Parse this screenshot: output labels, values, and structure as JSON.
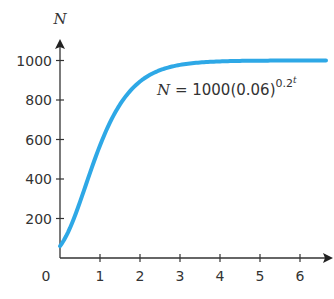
{
  "chart_data": {
    "type": "line",
    "title": "",
    "xlabel": "t",
    "ylabel": "N",
    "xlim": [
      0,
      6.5
    ],
    "ylim": [
      0,
      1100
    ],
    "x_ticks": [
      1,
      2,
      3,
      4,
      5,
      6
    ],
    "y_ticks": [
      200,
      400,
      600,
      800,
      1000
    ],
    "origin_label": "0",
    "grid": false,
    "legend": null,
    "series": [
      {
        "name": "N = 1000(0.06)^(0.2^t)",
        "color": "#2ea8e6",
        "function": "1000*0.06^(0.2^t)",
        "x": [
          0,
          0.25,
          0.5,
          0.75,
          1,
          1.25,
          1.5,
          1.75,
          2,
          2.5,
          3,
          3.5,
          4,
          5,
          6,
          6.5
        ],
        "values": [
          60,
          172,
          284,
          418,
          570,
          693,
          790,
          860,
          894,
          953,
          978,
          990,
          995,
          999,
          1000,
          1000
        ]
      }
    ],
    "annotations": [
      {
        "text": "N = 1000(0.06)^(0.2^t)",
        "x": 2.4,
        "y": 850
      }
    ]
  },
  "labels": {
    "y_axis_title": "N",
    "x_axis_title": "t",
    "origin": "0",
    "equation_lhs": "N",
    "equation_eq": " = 1000(0.06)",
    "equation_exp_base": "0.2",
    "equation_exp_power": "t",
    "y_ticks": [
      "200",
      "400",
      "600",
      "800",
      "1000"
    ],
    "x_ticks": [
      "1",
      "2",
      "3",
      "4",
      "5",
      "6"
    ]
  },
  "colors": {
    "curve": "#2ea8e6",
    "axis": "#333333"
  }
}
